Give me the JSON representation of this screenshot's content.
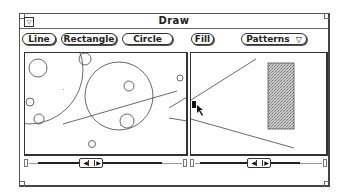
{
  "window": {
    "title": "Draw",
    "menu_icon": "▽"
  },
  "toolbar": {
    "buttons": [
      {
        "label": "Line"
      },
      {
        "label": "Rectangle"
      },
      {
        "label": "Circle"
      },
      {
        "label": "Fill"
      }
    ],
    "patterns_menu": {
      "label": "Patterns",
      "icon": "▽"
    }
  },
  "scrollbars": {
    "left_arrow": "◀",
    "right_arrow": "▶"
  },
  "colors": {
    "stroke": "#444444",
    "fill_pattern": "#b8b8b8",
    "window_border": "#555555"
  }
}
